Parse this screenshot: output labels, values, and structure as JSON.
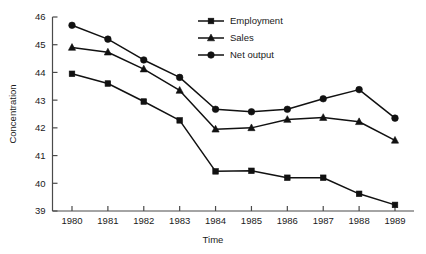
{
  "chart_data": {
    "type": "line",
    "title": "",
    "xlabel": "Time",
    "ylabel": "Concentration",
    "categories": [
      "1980",
      "1981",
      "1982",
      "1983",
      "1984",
      "1985",
      "1986",
      "1987",
      "1988",
      "1989"
    ],
    "x": [
      1980,
      1981,
      1982,
      1983,
      1984,
      1985,
      1986,
      1987,
      1988,
      1989
    ],
    "xlim": [
      1980,
      1989
    ],
    "ylim": [
      39,
      46
    ],
    "yticks": [
      39,
      40,
      41,
      42,
      43,
      44,
      45,
      46
    ],
    "xticks": [
      1980,
      1981,
      1982,
      1983,
      1984,
      1985,
      1986,
      1987,
      1988,
      1989
    ],
    "grid": false,
    "legend_position": "top-center",
    "series": [
      {
        "name": "Employment",
        "marker": "square",
        "color": "#111111",
        "values": [
          43.95,
          43.6,
          42.95,
          42.27,
          40.43,
          40.45,
          40.2,
          40.2,
          39.62,
          39.22
        ]
      },
      {
        "name": "Sales",
        "marker": "triangle",
        "color": "#111111",
        "values": [
          44.9,
          44.73,
          44.12,
          43.35,
          41.95,
          42.0,
          42.3,
          42.37,
          42.22,
          41.55
        ]
      },
      {
        "name": "Net output",
        "marker": "circle",
        "color": "#111111",
        "values": [
          45.7,
          45.2,
          44.45,
          43.82,
          42.67,
          42.58,
          42.67,
          43.05,
          43.38,
          42.35
        ]
      }
    ]
  },
  "axes": {
    "y_tick_labels": [
      "46",
      "45",
      "44",
      "43",
      "42",
      "41",
      "40",
      "39"
    ],
    "x_tick_labels": [
      "1980",
      "1981",
      "1982",
      "1983",
      "1984",
      "1985",
      "1986",
      "1987",
      "1988",
      "1989"
    ],
    "y_axis_title": "Concentration",
    "x_axis_title": "Time"
  },
  "legend": {
    "entries": [
      {
        "label": "Employment",
        "marker": "square"
      },
      {
        "label": "Sales",
        "marker": "triangle"
      },
      {
        "label": "Net output",
        "marker": "circle"
      }
    ]
  },
  "style": {
    "line_color": "#111111",
    "axis_color": "#4a4a4a",
    "background": "#ffffff"
  }
}
